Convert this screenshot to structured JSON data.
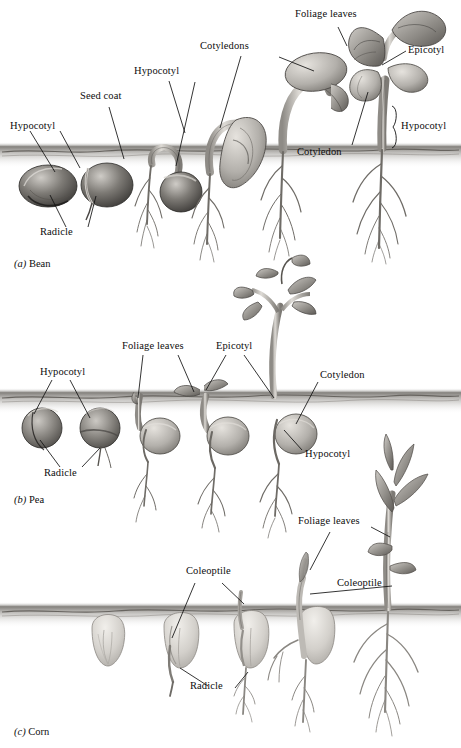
{
  "figure": {
    "background_color": "#ffffff",
    "ink_color": "#0d0d0d",
    "soil_color": "#8f8c86"
  },
  "panels": [
    {
      "id": "bean",
      "caption_tag": "(a)",
      "caption_name": "Bean",
      "soil_y": 152,
      "labels": [
        {
          "text": "Hypocotyl",
          "x": 10,
          "y": 125
        },
        {
          "text": "Radicle",
          "x": 40,
          "y": 231
        },
        {
          "text": "Seed coat",
          "x": 80,
          "y": 95
        },
        {
          "text": "Hypocotyl",
          "x": 134,
          "y": 70
        },
        {
          "text": "Cotyledons",
          "x": 200,
          "y": 45
        },
        {
          "text": "Foliage leaves",
          "x": 295,
          "y": 10
        },
        {
          "text": "Epicotyl",
          "x": 408,
          "y": 45
        },
        {
          "text": "Cotyledon",
          "x": 297,
          "y": 148
        },
        {
          "text": "Hypocotyl",
          "x": 401,
          "y": 123
        }
      ],
      "stages": 5
    },
    {
      "id": "pea",
      "caption_tag": "(b)",
      "caption_name": "Pea",
      "soil_y": 398,
      "labels": [
        {
          "text": "Hypocotyl",
          "x": 40,
          "y": 371
        },
        {
          "text": "Radicle",
          "x": 44,
          "y": 472
        },
        {
          "text": "Foliage leaves",
          "x": 122,
          "y": 344
        },
        {
          "text": "Epicotyl",
          "x": 216,
          "y": 344
        },
        {
          "text": "Cotyledon",
          "x": 320,
          "y": 373
        },
        {
          "text": "Hypocotyl",
          "x": 305,
          "y": 452
        }
      ],
      "stages": 5
    },
    {
      "id": "corn",
      "caption_tag": "(c)",
      "caption_name": "Corn",
      "soil_y": 612,
      "labels": [
        {
          "text": "Coleoptile",
          "x": 186,
          "y": 569
        },
        {
          "text": "Radicle",
          "x": 190,
          "y": 684
        },
        {
          "text": "Foliage leaves",
          "x": 298,
          "y": 518
        },
        {
          "text": "Coleoptile",
          "x": 337,
          "y": 580
        }
      ],
      "stages": 5
    }
  ]
}
